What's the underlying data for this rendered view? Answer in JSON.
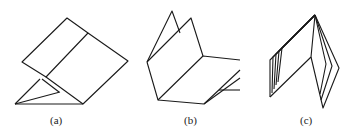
{
  "figure": {
    "stroke_color": "#1a1a1a",
    "background": "#ffffff",
    "panels": [
      {
        "id": "a",
        "label": "(a)"
      },
      {
        "id": "b",
        "label": "(b)"
      },
      {
        "id": "c",
        "label": "(c)"
      }
    ]
  }
}
